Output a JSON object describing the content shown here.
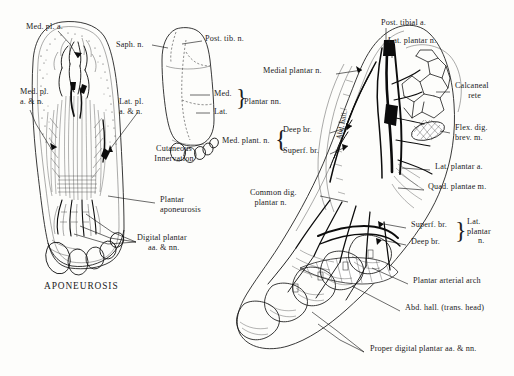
{
  "plate": {
    "caption_aponeurosis": "APONEUROSIS",
    "caption_cutaneous_line1": "Cutaneous",
    "caption_cutaneous_line2": "Innervation"
  },
  "left_figure": {
    "name": "plantar-aponeurosis-dissection",
    "labels": [
      {
        "id": "med-pl-a",
        "text": "Med. pl. a.",
        "x": 26,
        "y": 27,
        "align": "left"
      },
      {
        "id": "med-pl-a-n",
        "text": "Med. pl.\na. & n.",
        "x": 20,
        "y": 91,
        "align": "left"
      },
      {
        "id": "lat-pl-a-n",
        "text": "Lat. pl.\na. & n.",
        "x": 119,
        "y": 101,
        "align": "left"
      },
      {
        "id": "plantar-aponeurosis",
        "text": "Plantar\naponeurosis",
        "x": 160,
        "y": 199,
        "align": "left"
      },
      {
        "id": "digital-plantar-aa-nn",
        "text": "Digital plantar\n     aa. & nn.",
        "x": 137,
        "y": 237,
        "align": "left"
      }
    ]
  },
  "center_figure": {
    "name": "cutaneous-innervation-diagram",
    "labels": [
      {
        "id": "saph-n",
        "text": "Saph. n.",
        "x": 116,
        "y": 44,
        "align": "left"
      },
      {
        "id": "post-tib-n",
        "text": "Post. tib. n.",
        "x": 205,
        "y": 38,
        "align": "left"
      },
      {
        "id": "med",
        "text": "Med.",
        "x": 214,
        "y": 92,
        "align": "left"
      },
      {
        "id": "lat",
        "text": "Lat.",
        "x": 214,
        "y": 110,
        "align": "left"
      },
      {
        "id": "plantar-nn",
        "text": "Plantar nn.",
        "x": 244,
        "y": 101,
        "align": "left"
      }
    ]
  },
  "right_figure": {
    "name": "deep-plantar-dissection",
    "labels": [
      {
        "id": "post-tibial-a",
        "text": "Post. tibial a.",
        "x": 381,
        "y": 22,
        "align": "left"
      },
      {
        "id": "lat-plantar-n-top",
        "text": "Lat. plantar n.",
        "x": 388,
        "y": 40,
        "align": "left"
      },
      {
        "id": "medial-plantar-n",
        "text": "Medial plantar n.",
        "x": 263,
        "y": 70,
        "align": "left"
      },
      {
        "id": "calcaneal-rete",
        "text": "Calcaneal\n      rete",
        "x": 455,
        "y": 85,
        "align": "left"
      },
      {
        "id": "flex-dig-brev-m",
        "text": "Flex. dig.\nbrev. m.",
        "x": 455,
        "y": 127,
        "align": "left"
      },
      {
        "id": "lat-plantar-a",
        "text": "Lat. plantar a.",
        "x": 435,
        "y": 166,
        "align": "left"
      },
      {
        "id": "quad-plantae-m",
        "text": "Quad. plantae m.",
        "x": 428,
        "y": 186,
        "align": "left"
      },
      {
        "id": "med-plant-n",
        "text": "Med. plant. n.",
        "x": 222,
        "y": 140,
        "align": "left"
      },
      {
        "id": "deep-br-med",
        "text": "Deep br.",
        "x": 283,
        "y": 129,
        "align": "left"
      },
      {
        "id": "superf-br-med",
        "text": "Superf. br.",
        "x": 283,
        "y": 150,
        "align": "left"
      },
      {
        "id": "common-dig-plantar-n",
        "text": "Common dig.\n  plantar n.",
        "x": 250,
        "y": 192,
        "align": "left"
      },
      {
        "id": "superf-br-lat",
        "text": "Superf. br.",
        "x": 411,
        "y": 224,
        "align": "left"
      },
      {
        "id": "deep-br-lat",
        "text": "Deep br.",
        "x": 411,
        "y": 241,
        "align": "left"
      },
      {
        "id": "lat-plantar-n-brk",
        "text": "Lat.\nplantar\n     n.",
        "x": 470,
        "y": 222,
        "align": "left"
      },
      {
        "id": "plantar-arterial-arch",
        "text": "Plantar arterial arch",
        "x": 413,
        "y": 280,
        "align": "left"
      },
      {
        "id": "abd-hall-trans-head",
        "text": "Abd. hall. (trans. head)",
        "x": 405,
        "y": 307,
        "align": "left"
      },
      {
        "id": "proper-digital-plantar",
        "text": "Proper digital plantar aa. & nn.",
        "x": 370,
        "y": 348,
        "align": "left"
      },
      {
        "id": "abd-hall-inline",
        "text": "Abd. hall.",
        "x": 0,
        "y": 0,
        "align": "left"
      }
    ]
  }
}
